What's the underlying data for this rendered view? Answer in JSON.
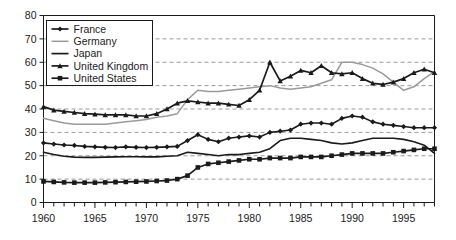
{
  "chart_data": {
    "type": "line",
    "title": "",
    "subtitle": "",
    "xlabel": "",
    "ylabel": "",
    "xlim": [
      1960,
      1998
    ],
    "ylim": [
      0,
      80
    ],
    "grid": true,
    "grid_axis": "y",
    "legend_position": "top-left",
    "y_ticks": [
      0,
      10,
      20,
      30,
      40,
      50,
      60,
      70,
      80
    ],
    "y_tick_labels": [
      "0",
      "10",
      "20",
      "30",
      "40",
      "50",
      "60",
      "70",
      "80"
    ],
    "x_ticks": [
      1960,
      1965,
      1970,
      1975,
      1980,
      1985,
      1990,
      1995
    ],
    "x_tick_labels": [
      "1960",
      "1965",
      "1970",
      "1975",
      "1980",
      "1985",
      "1990",
      "1995"
    ],
    "x_minor_ticks": [
      1961,
      1962,
      1963,
      1964,
      1966,
      1967,
      1968,
      1969,
      1971,
      1972,
      1973,
      1974,
      1976,
      1977,
      1978,
      1979,
      1981,
      1982,
      1983,
      1984,
      1986,
      1987,
      1988,
      1989,
      1991,
      1992,
      1993,
      1994,
      1996,
      1997,
      1998
    ],
    "x": [
      1960,
      1961,
      1962,
      1963,
      1964,
      1965,
      1966,
      1967,
      1968,
      1969,
      1970,
      1971,
      1972,
      1973,
      1974,
      1975,
      1976,
      1977,
      1978,
      1979,
      1980,
      1981,
      1982,
      1983,
      1984,
      1985,
      1986,
      1987,
      1988,
      1989,
      1990,
      1991,
      1992,
      1993,
      1994,
      1995,
      1996,
      1997,
      1998
    ],
    "series": [
      {
        "name": "France",
        "color": "#1a1a1a",
        "marker": "diamond",
        "width": 1.6,
        "values": [
          25.5,
          25.0,
          24.6,
          24.4,
          24.0,
          23.8,
          23.6,
          23.5,
          23.8,
          23.6,
          23.5,
          23.6,
          23.8,
          24.0,
          26.5,
          29.0,
          27.0,
          26.0,
          27.5,
          28.0,
          28.5,
          28.0,
          30.0,
          30.5,
          31.0,
          33.5,
          34.0,
          34.0,
          33.5,
          36.0,
          37.0,
          36.5,
          34.5,
          33.5,
          33.0,
          32.5,
          32.0,
          32.0,
          32.0
        ]
      },
      {
        "name": "Germany",
        "color": "#9a9a9a",
        "marker": "none",
        "width": 1.5,
        "values": [
          36.0,
          35.0,
          34.0,
          33.5,
          33.5,
          33.5,
          33.5,
          34.0,
          34.5,
          35.0,
          35.5,
          36.5,
          37.0,
          38.0,
          44.0,
          48.0,
          47.5,
          47.5,
          48.0,
          48.5,
          49.0,
          49.5,
          50.0,
          49.0,
          48.5,
          49.0,
          49.5,
          51.0,
          52.5,
          60.0,
          60.0,
          59.0,
          57.5,
          55.0,
          51.5,
          48.0,
          49.5,
          53.0,
          56.0
        ]
      },
      {
        "name": "Japan",
        "color": "#1a1a1a",
        "marker": "none",
        "width": 1.6,
        "values": [
          21.5,
          20.5,
          19.8,
          19.4,
          19.3,
          19.3,
          19.4,
          19.5,
          19.6,
          19.6,
          19.5,
          19.5,
          19.8,
          20.0,
          21.5,
          21.0,
          20.5,
          20.0,
          20.5,
          20.5,
          21.0,
          21.5,
          23.0,
          26.5,
          27.5,
          27.5,
          27.0,
          26.5,
          25.5,
          25.0,
          25.5,
          26.5,
          27.5,
          27.5,
          27.5,
          27.0,
          26.0,
          24.5,
          21.0
        ]
      },
      {
        "name": "United Kingdom",
        "color": "#1a1a1a",
        "marker": "triangle",
        "width": 1.7,
        "values": [
          41.0,
          39.5,
          39.0,
          38.5,
          38.0,
          37.8,
          37.5,
          37.5,
          37.5,
          37.0,
          37.0,
          38.0,
          40.0,
          42.5,
          43.5,
          43.0,
          42.5,
          42.5,
          42.0,
          41.5,
          44.0,
          48.0,
          60.0,
          52.0,
          54.0,
          56.5,
          55.5,
          58.5,
          55.5,
          55.0,
          55.5,
          53.0,
          51.0,
          50.5,
          51.5,
          53.0,
          55.5,
          57.0,
          55.5
        ]
      },
      {
        "name": "United States",
        "color": "#1a1a1a",
        "marker": "square",
        "width": 1.7,
        "values": [
          9.0,
          8.8,
          8.6,
          8.5,
          8.5,
          8.5,
          8.6,
          8.7,
          8.8,
          8.9,
          9.0,
          9.2,
          9.4,
          10.0,
          11.5,
          15.0,
          16.5,
          17.0,
          17.5,
          18.0,
          18.5,
          18.5,
          19.0,
          19.0,
          19.0,
          19.5,
          19.5,
          19.5,
          20.0,
          20.5,
          21.0,
          21.0,
          21.0,
          21.0,
          21.5,
          22.0,
          22.5,
          23.0,
          23.0
        ]
      }
    ],
    "legend": [
      {
        "label": "France",
        "color": "#1a1a1a",
        "marker": "diamond"
      },
      {
        "label": "Germany",
        "color": "#9a9a9a",
        "marker": "none"
      },
      {
        "label": "Japan",
        "color": "#1a1a1a",
        "marker": "none"
      },
      {
        "label": "United Kingdom",
        "color": "#1a1a1a",
        "marker": "triangle"
      },
      {
        "label": "United States",
        "color": "#1a1a1a",
        "marker": "square"
      }
    ],
    "colors": {
      "axis": "#1a1a1a",
      "grid": "#9a9a9a",
      "background": "#ffffff",
      "dark_series": "#1a1a1a",
      "gray_series": "#9a9a9a"
    }
  }
}
